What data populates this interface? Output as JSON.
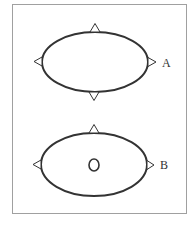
{
  "diagram": {
    "frame": {
      "x": 12,
      "y": 4,
      "width": 174,
      "height": 209,
      "stroke": "#a0a0a0"
    },
    "figures": [
      {
        "id": "A",
        "label": "A",
        "ellipse": {
          "cx": 95,
          "cy": 62,
          "rx": 53,
          "ry": 30
        },
        "markers": [
          "top-triangle",
          "bottom-triangle",
          "left-triangle",
          "right-triangle"
        ],
        "inner_circle": false
      },
      {
        "id": "B",
        "label": "B",
        "ellipse": {
          "cx": 94,
          "cy": 164.5,
          "rx": 53,
          "ry": 31.5
        },
        "markers": [
          "top-triangle",
          "left-triangle",
          "right-triangle"
        ],
        "inner_circle": true
      }
    ],
    "stroke_color": "#333333"
  }
}
